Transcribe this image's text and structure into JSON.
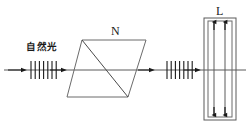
{
  "figure": {
    "background_color": "#ffffff",
    "stroke_color": "#3a3a3a",
    "axis_color": "#555555",
    "labels": {
      "source_light": "自然光",
      "prism": "N",
      "cell": "L"
    },
    "elements": {
      "optical_axis": {
        "name": "horizontal-light-ray",
        "y": 70,
        "x_start": 4,
        "x_end": 246,
        "arrow_positions": [
          22,
          62,
          150,
          196
        ]
      },
      "polarizer_marks_left": {
        "name": "left-tick-group",
        "count": 7,
        "x_start": 31,
        "spacing": 4.2,
        "half_height": 9
      },
      "polarizer_marks_right": {
        "name": "right-tick-group",
        "count": 7,
        "x_start": 167,
        "spacing": 4.2,
        "half_height": 9
      },
      "prism": {
        "name": "nicol-prism-parallelogram",
        "points": "82,40 146,40 128,97 67,97",
        "diagonal": "82,40 128,97"
      },
      "cell": {
        "name": "kerr-cell-L",
        "outer_rect": {
          "x": 204,
          "y": 18,
          "w": 32,
          "h": 102
        },
        "inner_rect": {
          "x": 208,
          "y": 21,
          "w": 24,
          "h": 96
        },
        "plate_lines_x": [
          214,
          225
        ],
        "plate_top": 21,
        "plate_bottom": 117,
        "arrow_direction_top": "up",
        "arrow_direction_bottom": "down"
      }
    }
  }
}
